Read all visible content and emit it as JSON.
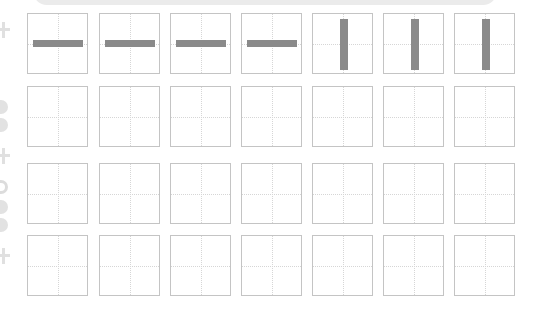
{
  "worksheet": {
    "type": "character-writing-grid",
    "rows": 4,
    "cols": 7,
    "stroke_color": "#8a8a8a",
    "grid_border_color": "#c4c4c4",
    "guide_line_color": "#d6d6d6",
    "banner_color": "#ebebeb",
    "cells": [
      [
        "heng",
        "heng",
        "heng",
        "heng",
        "shu",
        "shu",
        "shu"
      ],
      [
        "",
        "",
        "",
        "",
        "",
        "",
        ""
      ],
      [
        "",
        "",
        "",
        "",
        "",
        "",
        ""
      ],
      [
        "",
        "",
        "",
        "",
        "",
        "",
        ""
      ]
    ]
  }
}
